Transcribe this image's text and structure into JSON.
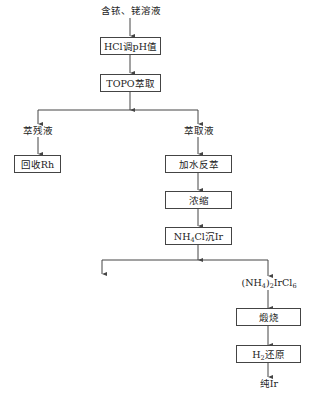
{
  "diagram": {
    "type": "process-flowchart",
    "start": "含铱、铑溶液",
    "steps": {
      "hcl_ph": "HCl调pH值",
      "topo": "TOPO萃取"
    },
    "left_branch": {
      "product": "萃残液",
      "step": "回收Rh"
    },
    "right_branch": {
      "product": "萃取液",
      "steps": [
        "加水反萃",
        "浓缩"
      ],
      "precip": {
        "pre": "NH",
        "sub": "4",
        "post": "Cl沉Ir"
      }
    },
    "precip_branch": {
      "left_product": "",
      "right_product": {
        "p1": "(NH",
        "s1": "4",
        "p2": ")",
        "s2": "2",
        "p3": "IrCl",
        "s3": "6"
      },
      "calcine": "煅烧",
      "reduce": {
        "pre": "H",
        "sub": "2",
        "post": "还原"
      },
      "final": "纯Ir"
    },
    "colors": {
      "line": "#444444",
      "text": "#222222",
      "background": "#ffffff"
    }
  }
}
